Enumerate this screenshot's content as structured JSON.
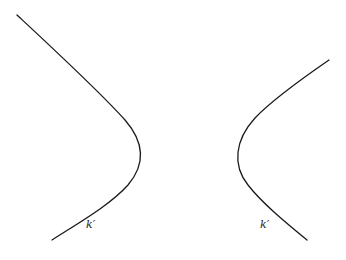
{
  "diagram": {
    "type": "hyperbola-branches",
    "branches": [
      {
        "id": "left",
        "label": "k′",
        "vertex": [
          141,
          152
        ],
        "start": [
          17,
          15
        ],
        "end": [
          52,
          240
        ],
        "opens": "left"
      },
      {
        "id": "right",
        "label": "k′",
        "vertex": [
          237,
          155
        ],
        "start": [
          329,
          60
        ],
        "end": [
          307,
          240
        ],
        "opens": "right"
      }
    ]
  },
  "labels": {
    "left": "k′",
    "right": "k′"
  }
}
